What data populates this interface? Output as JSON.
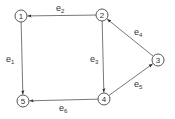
{
  "diagram": {
    "type": "directed-graph",
    "nodes": [
      {
        "id": "1",
        "label": "1",
        "x": 21,
        "y": 16
      },
      {
        "id": "2",
        "label": "2",
        "x": 102,
        "y": 15
      },
      {
        "id": "3",
        "label": "3",
        "x": 158,
        "y": 60
      },
      {
        "id": "4",
        "label": "4",
        "x": 104,
        "y": 99
      },
      {
        "id": "5",
        "label": "5",
        "x": 23,
        "y": 101
      }
    ],
    "edges": [
      {
        "id": "e1",
        "label": "e",
        "sub": "1",
        "from": "1",
        "to": "5",
        "lx": 6,
        "ly": 62
      },
      {
        "id": "e2",
        "label": "e",
        "sub": "2",
        "from": "2",
        "to": "1",
        "lx": 56,
        "ly": 11
      },
      {
        "id": "e3",
        "label": "e",
        "sub": "3",
        "from": "2",
        "to": "4",
        "lx": 90,
        "ly": 62
      },
      {
        "id": "e4",
        "label": "e",
        "sub": "4",
        "from": "3",
        "to": "2",
        "lx": 134,
        "ly": 35
      },
      {
        "id": "e5",
        "label": "e",
        "sub": "5",
        "from": "4",
        "to": "3",
        "lx": 134,
        "ly": 87
      },
      {
        "id": "e6",
        "label": "e",
        "sub": "6",
        "from": "4",
        "to": "5",
        "lx": 59,
        "ly": 111
      }
    ]
  }
}
